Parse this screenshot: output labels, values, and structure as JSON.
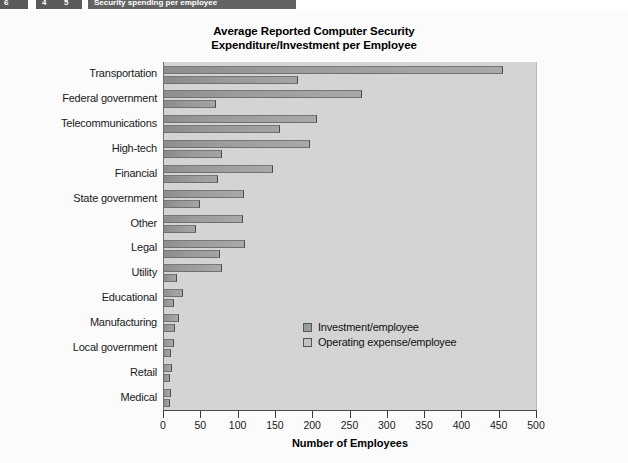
{
  "header": {
    "book_chapter": "6",
    "nav_prev": "4",
    "nav_next": "5",
    "strip_title": "Security spending per employee"
  },
  "chart_data": {
    "type": "bar",
    "orientation": "horizontal",
    "title": "Average Reported Computer Security Expenditure/Investment per Employee",
    "title_line1": "Average Reported Computer Security",
    "title_line2": "Expenditure/Investment per Employee",
    "xlabel": "Number of Employees",
    "ylabel": "",
    "xlim": [
      0,
      500
    ],
    "xticks": [
      0,
      50,
      100,
      150,
      200,
      250,
      300,
      350,
      400,
      450,
      500
    ],
    "xtick_labels": [
      "0",
      "50",
      "100",
      "150",
      "200",
      "250",
      "300",
      "350",
      "400",
      "450",
      "500"
    ],
    "grid": false,
    "legend_position": "center-right",
    "categories": [
      "Transportation",
      "Federal government",
      "Telecommunications",
      "High-tech",
      "Financial",
      "State government",
      "Other",
      "Legal",
      "Utility",
      "Educational",
      "Manufacturing",
      "Local government",
      "Retail",
      "Medical"
    ],
    "series": [
      {
        "name": "Investment/employee",
        "color": "#9a9a9a",
        "values": [
          455,
          266,
          205,
          196,
          146,
          107,
          106,
          108,
          78,
          25,
          20,
          13,
          11,
          10
        ]
      },
      {
        "name": "Operating expense/employee",
        "color": "#c2c2c2",
        "values": [
          180,
          70,
          155,
          78,
          72,
          48,
          43,
          75,
          18,
          13,
          15,
          10,
          8,
          8
        ]
      }
    ]
  }
}
